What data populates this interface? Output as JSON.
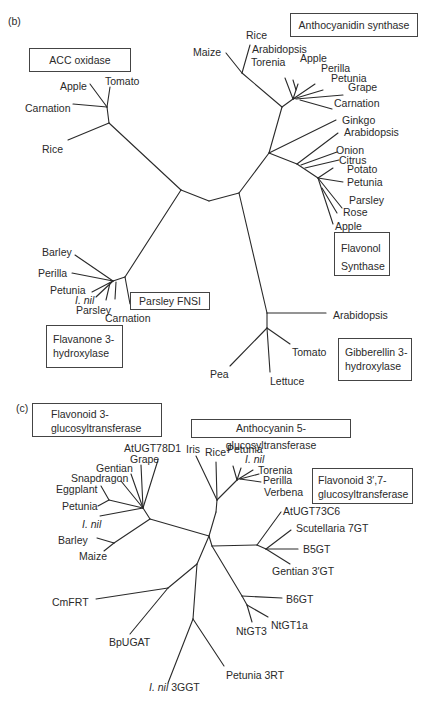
{
  "panel_b": {
    "label": "(b)",
    "groups": {
      "acc_oxidase": "ACC oxidase",
      "anthocyanidin_synthase": "Anthocyanidin synthase",
      "flavonol_synthase_1": "Flavonol",
      "flavonol_synthase_2": "Synthase",
      "parsley_fnsi": "Parsley FNSI",
      "flavanone_3h_1": "Flavanone 3-",
      "flavanone_3h_2": "hydroxylase",
      "gibberellin_3h_1": "Gibberellin 3-",
      "gibberellin_3h_2": "hydroxylase"
    },
    "leaves": {
      "acc_apple": "Apple",
      "acc_tomato": "Tomato",
      "acc_carnation": "Carnation",
      "acc_rice": "Rice",
      "ans_maize": "Maize",
      "ans_rice": "Rice",
      "ans_arabidopsis": "Arabidopsis",
      "ans_torenia": "Torenia",
      "ans_apple": "Apple",
      "ans_perilla": "Perilla",
      "ans_petunia": "Petunia",
      "ans_grape": "Grape",
      "ans_carnation": "Carnation",
      "fls_ginkgo": "Ginkgo",
      "fls_arabidopsis": "Arabidopsis",
      "fls_onion": "Onion",
      "fls_citrus": "Citrus",
      "fls_potato": "Potato",
      "fls_petunia": "Petunia",
      "fls_parsley": "Parsley",
      "fls_rose": "Rose",
      "fls_apple": "Apple",
      "f3h_barley": "Barley",
      "f3h_perilla": "Perilla",
      "f3h_petunia": "Petunia",
      "f3h_inil": "I. nil",
      "f3h_parsley": "Parsley",
      "f3h_carnation": "Carnation",
      "ga3_arabidopsis": "Arabidopsis",
      "ga3_tomato": "Tomato",
      "ga3_pea": "Pea",
      "ga3_lettuce": "Lettuce"
    }
  },
  "panel_c": {
    "label": "(c)",
    "groups": {
      "f3gt_1": "Flavonoid 3-",
      "f3gt_2": "glucosyltransferase",
      "a5gt": "Anthocyanin 5-glucosyltransferase",
      "f37gt_1": "Flavonoid 3′,7-",
      "f37gt_2": "glucosyltransferase"
    },
    "leaves": {
      "atugt78d1": "AtUGT78D1",
      "grape": "Grape",
      "gentian": "Gentian",
      "snapdragon": "Snapdragon",
      "eggplant": "Eggplant",
      "petunia": "Petunia",
      "inil": "I. nil",
      "barley": "Barley",
      "maize": "Maize",
      "iris": "Iris",
      "rice": "Rice",
      "a5_petunia": "Petunia",
      "a5_inil": "I. nil",
      "torenia": "Torenia",
      "perilla": "Perilla",
      "verbena": "Verbena",
      "atugt73c6": "AtUGT73C6",
      "scutellaria": "Scutellaria 7GT",
      "b5gt": "B5GT",
      "gentian3gt": "Gentian 3′GT",
      "b6gt": "B6GT",
      "ntgt1a": "NtGT1a",
      "ntgt3": "NtGT3",
      "cmfrt": "CmFRT",
      "bpugat": "BpUGAT",
      "petunia3rt": "Petunia 3RT",
      "inil3ggt_italic": "I. nil",
      "inil3ggt_rest": " 3GGT"
    }
  },
  "colors": {
    "line": "#2a2a2a",
    "text": "#2a2a2a",
    "box_border": "#444444"
  }
}
